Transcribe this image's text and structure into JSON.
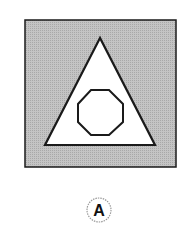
{
  "figure": {
    "option_label": "A",
    "shapes": {
      "outer": "square",
      "middle": "triangle",
      "inner": "octagon"
    },
    "colors": {
      "square_fill": "#b8b8b8",
      "stroke": "#1a1a1a",
      "inner_fill": "#ffffff",
      "label_circle": "#9a9a9a"
    }
  }
}
